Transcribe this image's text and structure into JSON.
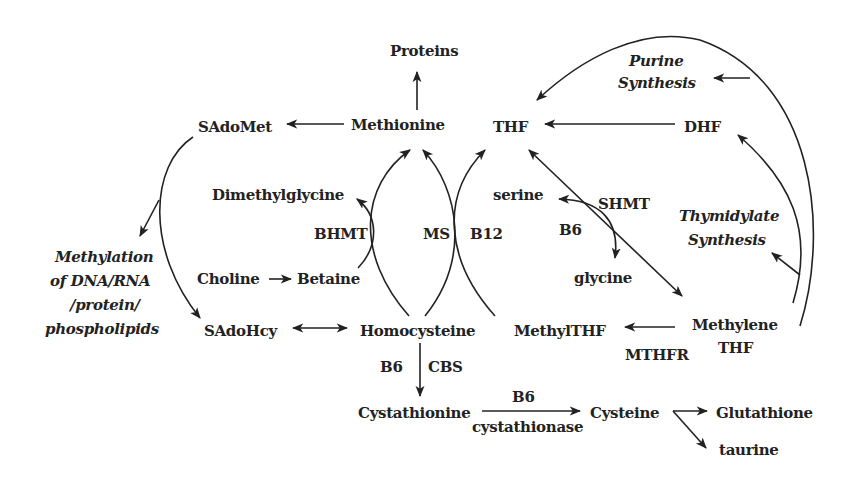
{
  "diagram": {
    "nodes": {
      "proteins": "Proteins",
      "methionine": "Methionine",
      "sadomet": "SAdoMet",
      "thf": "THF",
      "dhf": "DHF",
      "purine_1": "Purine",
      "purine_2": "Synthesis",
      "dimethylglycine": "Dimethylglycine",
      "serine": "serine",
      "glycine": "glycine",
      "thymidylate_1": "Thymidylate",
      "thymidylate_2": "Synthesis",
      "methylation_1": "Methylation",
      "methylation_2": "of DNA/RNA",
      "methylation_3": "/protein/",
      "methylation_4": "phospholipids",
      "choline": "Choline",
      "betaine": "Betaine",
      "sadohcy": "SAdoHcy",
      "homocysteine": "Homocysteine",
      "methylthf": "MethylTHF",
      "methylene_1": "Methylene",
      "methylene_2": "THF",
      "cystathionine": "Cystathionine",
      "cysteine": "Cysteine",
      "glutathione": "Glutathione",
      "taurine": "taurine"
    },
    "enzymes": {
      "bhmt": "BHMT",
      "ms": "MS",
      "b12": "B12",
      "shmt": "SHMT",
      "b6_shmt": "B6",
      "mthfr": "MTHFR",
      "b6_cbs": "B6",
      "cbs": "CBS",
      "b6_cystathionase": "B6",
      "cystathionase": "cystathionase"
    },
    "edges": [
      {
        "from": "Methionine",
        "to": "Proteins"
      },
      {
        "from": "Methionine",
        "to": "SAdoMet"
      },
      {
        "from": "SAdoMet",
        "to": "Methylation of DNA/RNA/protein/phospholipids"
      },
      {
        "from": "SAdoMet",
        "to": "SAdoHcy"
      },
      {
        "from": "SAdoHcy",
        "to": "Homocysteine",
        "bidirectional": true
      },
      {
        "from": "Choline",
        "to": "Betaine"
      },
      {
        "from": "Betaine",
        "to": "Dimethylglycine",
        "enzyme": "BHMT"
      },
      {
        "from": "Homocysteine",
        "to": "Methionine",
        "enzyme": "BHMT"
      },
      {
        "from": "Homocysteine",
        "to": "Methionine",
        "enzyme": "MS"
      },
      {
        "from": "MethylTHF",
        "to": "THF",
        "enzyme": "B12"
      },
      {
        "from": "DHF",
        "to": "THF"
      },
      {
        "from": "THF",
        "to": "Methylene THF",
        "enzyme": "SHMT"
      },
      {
        "from": "serine",
        "to": "glycine",
        "enzyme": "SHMT / B6"
      },
      {
        "from": "Methylene THF",
        "to": "MethylTHF",
        "enzyme": "MTHFR"
      },
      {
        "from": "Methylene THF",
        "to": "Thymidylate Synthesis"
      },
      {
        "from": "Methylene THF",
        "to": "DHF"
      },
      {
        "from": "Methylene THF",
        "to": "Purine Synthesis"
      },
      {
        "from": "Methylene THF",
        "to": "THF"
      },
      {
        "from": "Homocysteine",
        "to": "Cystathionine",
        "enzyme": "CBS / B6"
      },
      {
        "from": "Cystathionine",
        "to": "Cysteine",
        "enzyme": "cystathionase / B6"
      },
      {
        "from": "Cysteine",
        "to": "Glutathione"
      },
      {
        "from": "Cysteine",
        "to": "taurine"
      }
    ]
  }
}
